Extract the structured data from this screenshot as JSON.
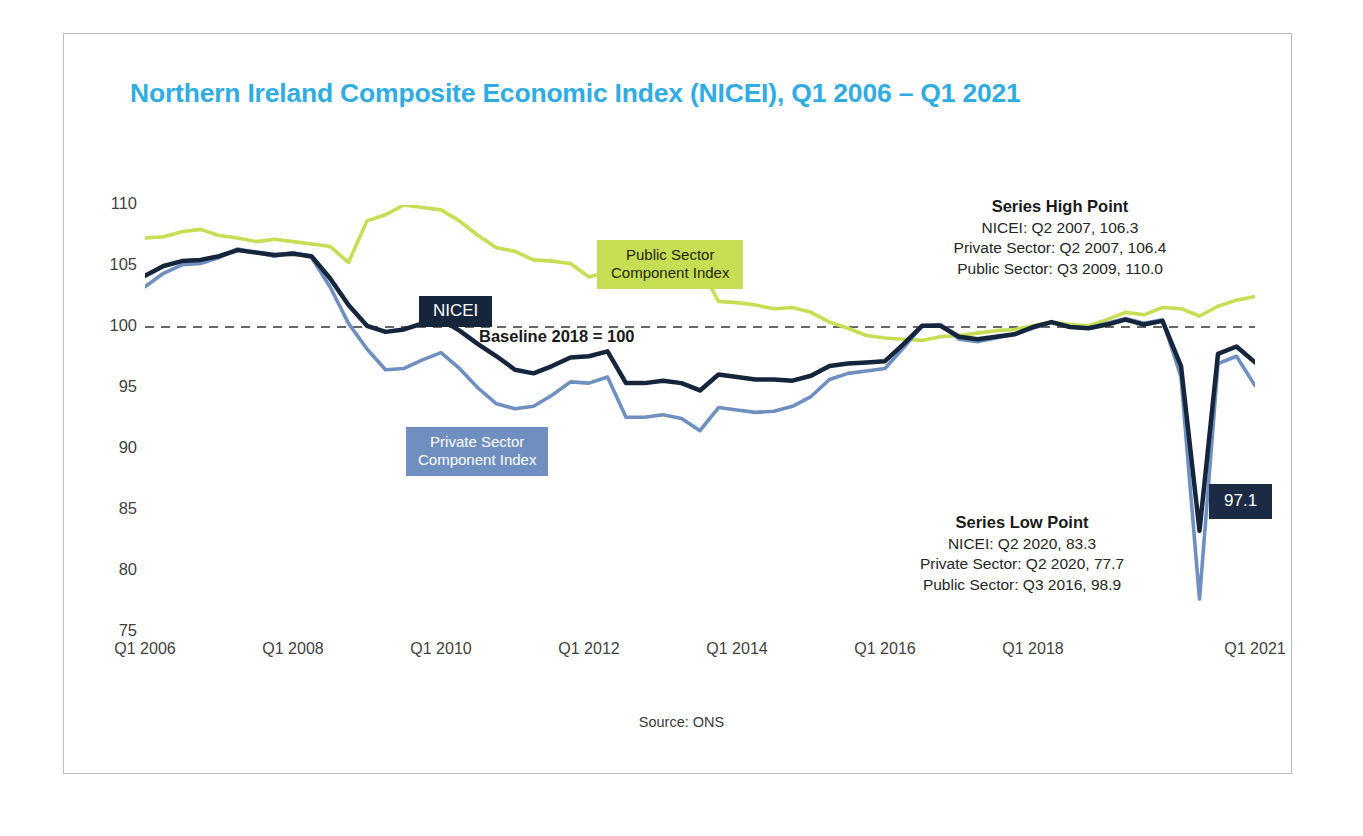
{
  "title": "Northern Ireland Composite Economic Index (NICEI), Q1 2006 – Q1 2021",
  "source_note": "Source: ONS",
  "baseline_label": "Baseline 2018 = 100",
  "callouts": {
    "nicei": "NICEI",
    "public_line1": "Public Sector",
    "public_line2": "Component Index",
    "private_line1": "Private Sector",
    "private_line2": "Component Index",
    "latest_value": "97.1"
  },
  "annotations": {
    "high": {
      "heading": "Series High Point",
      "lines": [
        "NICEI: Q2 2007, 106.3",
        "Private Sector: Q2 2007, 106.4",
        "Public Sector: Q3 2009, 110.0"
      ]
    },
    "low": {
      "heading": "Series Low Point",
      "lines": [
        "NICEI: Q2 2020, 83.3",
        "Private Sector: Q2 2020, 77.7",
        "Public Sector: Q3 2016, 98.9"
      ]
    }
  },
  "colors": {
    "title": "#31ace3",
    "nicei": "#15263c",
    "private": "#6f8fc0",
    "public": "#c6de54",
    "baseline": "#333333",
    "frame": "#bdbdbd"
  },
  "chart_data": {
    "type": "line",
    "title": "Northern Ireland Composite Economic Index (NICEI), Q1 2006 – Q1 2021",
    "xlabel": "",
    "ylabel": "",
    "ylim": [
      75,
      110
    ],
    "yticks": [
      110,
      105,
      100,
      95,
      90,
      85,
      80,
      75
    ],
    "grid": false,
    "legend": "inline-callouts",
    "baseline": {
      "value": 100,
      "label": "Baseline 2018 = 100",
      "style": "dashed"
    },
    "x": [
      "Q1 2006",
      "Q2 2006",
      "Q3 2006",
      "Q4 2006",
      "Q1 2007",
      "Q2 2007",
      "Q3 2007",
      "Q4 2007",
      "Q1 2008",
      "Q2 2008",
      "Q3 2008",
      "Q4 2008",
      "Q1 2009",
      "Q2 2009",
      "Q3 2009",
      "Q4 2009",
      "Q1 2010",
      "Q2 2010",
      "Q3 2010",
      "Q4 2010",
      "Q1 2011",
      "Q2 2011",
      "Q3 2011",
      "Q4 2011",
      "Q1 2012",
      "Q2 2012",
      "Q3 2012",
      "Q4 2012",
      "Q1 2013",
      "Q2 2013",
      "Q3 2013",
      "Q4 2013",
      "Q1 2014",
      "Q2 2014",
      "Q3 2014",
      "Q4 2014",
      "Q1 2015",
      "Q2 2015",
      "Q3 2015",
      "Q4 2015",
      "Q1 2016",
      "Q2 2016",
      "Q3 2016",
      "Q4 2016",
      "Q1 2017",
      "Q2 2017",
      "Q3 2017",
      "Q4 2017",
      "Q1 2018",
      "Q2 2018",
      "Q3 2018",
      "Q4 2018",
      "Q1 2019",
      "Q2 2019",
      "Q3 2019",
      "Q4 2019",
      "Q1 2020",
      "Q2 2020",
      "Q3 2020",
      "Q4 2020",
      "Q1 2021"
    ],
    "xtick_labels": [
      "Q1 2006",
      "Q1 2008",
      "Q1 2010",
      "Q1 2012",
      "Q1 2014",
      "Q1 2016",
      "Q1 2018",
      "Q1 2021"
    ],
    "xtick_indices": [
      0,
      8,
      16,
      24,
      32,
      40,
      48,
      60
    ],
    "series": [
      {
        "name": "NICEI",
        "color": "#15263c",
        "width": 4.5,
        "values": [
          104.2,
          105.0,
          105.4,
          105.5,
          105.8,
          106.3,
          106.1,
          105.9,
          106.0,
          105.8,
          104.0,
          101.8,
          100.1,
          99.6,
          99.8,
          100.3,
          100.6,
          99.7,
          98.6,
          97.6,
          96.5,
          96.2,
          96.8,
          97.5,
          97.6,
          98.0,
          95.4,
          95.4,
          95.6,
          95.4,
          94.8,
          96.1,
          95.9,
          95.7,
          95.7,
          95.6,
          96.0,
          96.8,
          97.0,
          97.1,
          97.2,
          98.6,
          100.1,
          100.1,
          99.2,
          99.0,
          99.2,
          99.4,
          100.0,
          100.4,
          100.0,
          99.9,
          100.2,
          100.6,
          100.2,
          100.5,
          96.8,
          83.3,
          97.8,
          98.4,
          97.1
        ]
      },
      {
        "name": "Private Sector Component Index",
        "color": "#6f8fc0",
        "width": 3.6,
        "values": [
          103.3,
          104.4,
          105.1,
          105.2,
          105.7,
          106.4,
          106.1,
          105.8,
          106.1,
          105.7,
          103.3,
          100.3,
          98.2,
          96.5,
          96.6,
          97.3,
          97.9,
          96.6,
          95.0,
          93.7,
          93.3,
          93.5,
          94.4,
          95.5,
          95.4,
          95.9,
          92.6,
          92.6,
          92.8,
          92.5,
          91.5,
          93.4,
          93.2,
          93.0,
          93.1,
          93.5,
          94.3,
          95.7,
          96.2,
          96.4,
          96.6,
          98.3,
          100.1,
          100.2,
          99.0,
          98.8,
          99.1,
          99.4,
          99.9,
          100.4,
          100.0,
          99.9,
          100.3,
          100.7,
          100.3,
          100.6,
          95.9,
          77.7,
          97.0,
          97.6,
          95.2
        ]
      },
      {
        "name": "Public Sector Component Index",
        "color": "#c6de54",
        "width": 3.6,
        "values": [
          107.3,
          107.4,
          107.8,
          108.0,
          107.5,
          107.3,
          107.0,
          107.2,
          107.0,
          106.8,
          106.6,
          105.3,
          108.7,
          109.2,
          110.0,
          109.8,
          109.6,
          108.7,
          107.5,
          106.5,
          106.2,
          105.5,
          105.4,
          105.2,
          104.1,
          104.5,
          104.4,
          104.2,
          103.9,
          103.4,
          104.9,
          102.1,
          102.0,
          101.8,
          101.5,
          101.6,
          101.2,
          100.4,
          99.9,
          99.3,
          99.1,
          99.0,
          98.9,
          99.2,
          99.3,
          99.5,
          99.7,
          99.8,
          100.1,
          100.4,
          100.2,
          100.1,
          100.6,
          101.2,
          101.0,
          101.6,
          101.5,
          100.9,
          101.7,
          102.2,
          102.5
        ]
      }
    ]
  }
}
